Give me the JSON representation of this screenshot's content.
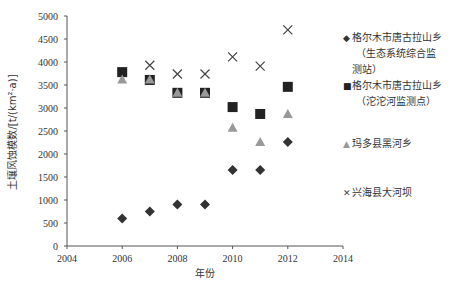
{
  "chart_data": {
    "type": "scatter",
    "title": "",
    "xlabel": "年份",
    "ylabel": "土壤风蚀模数/[t/(km²·a)]",
    "xlim": [
      2004,
      2014
    ],
    "ylim": [
      0,
      5000
    ],
    "x_ticks": [
      "2004",
      "2006",
      "2008",
      "2010",
      "2012",
      "2014"
    ],
    "y_ticks": [
      "0",
      "500",
      "1000",
      "1500",
      "2000",
      "2500",
      "3000",
      "3500",
      "4000",
      "4500",
      "5000"
    ],
    "grid": false,
    "legend_position": "right",
    "x": [
      2006,
      2007,
      2008,
      2009,
      2010,
      2011,
      2012
    ],
    "series": [
      {
        "name": "格尔木市唐古拉山乡（生态系统综合监测站）",
        "marker": "diamond",
        "color": "#333333",
        "values": [
          600,
          750,
          900,
          900,
          1650,
          1650,
          2260
        ]
      },
      {
        "name": "格尔木市唐古拉山乡（沱沱河监测点）",
        "marker": "square",
        "color": "#222222",
        "values": [
          3780,
          3610,
          3330,
          3330,
          3020,
          2870,
          3460
        ]
      },
      {
        "name": "玛多县黑河乡",
        "marker": "triangle",
        "color": "#999999",
        "values": [
          3620,
          3620,
          3330,
          3330,
          2570,
          2260,
          2870
        ]
      },
      {
        "name": "兴海县大河坝",
        "marker": "x",
        "color": "#444444",
        "values": [
          null,
          3930,
          3740,
          3740,
          4110,
          3910,
          4700
        ]
      }
    ]
  },
  "legend": {
    "items": [
      {
        "symbol": "◆",
        "lines": [
          "格尔木市唐古拉山乡",
          "（生态系统综合监",
          "测站）"
        ]
      },
      {
        "symbol": "■",
        "lines": [
          "格尔木市唐古拉山乡",
          "（沱沱河监测点）"
        ]
      },
      {
        "symbol": "▲",
        "lines": [
          "玛多县黑河乡"
        ]
      },
      {
        "symbol": "✕",
        "lines": [
          "兴海县大河坝"
        ]
      }
    ]
  }
}
